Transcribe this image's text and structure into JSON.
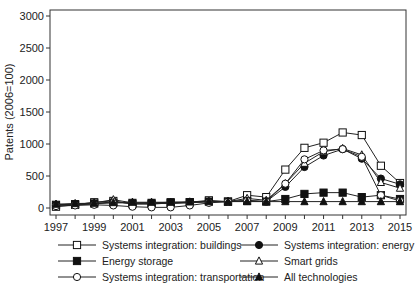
{
  "chart_data": {
    "type": "line",
    "title": "",
    "xlabel": "",
    "ylabel": "Patents (2006=100)",
    "ylim": [
      0,
      3000
    ],
    "yticks": [
      0,
      500,
      1000,
      1500,
      2000,
      2500,
      3000
    ],
    "xticks": [
      1997,
      1999,
      2001,
      2003,
      2005,
      2007,
      2009,
      2011,
      2013,
      2015
    ],
    "x": [
      1997,
      1998,
      1999,
      2000,
      2001,
      2002,
      2003,
      2004,
      2005,
      2006,
      2007,
      2008,
      2009,
      2010,
      2011,
      2012,
      2013,
      2014,
      2015
    ],
    "grid": false,
    "legend_position": "bottom",
    "series": [
      {
        "name": "Systems integration: buildings",
        "marker": "square-open",
        "values": [
          20,
          50,
          90,
          110,
          60,
          60,
          80,
          90,
          120,
          100,
          200,
          170,
          600,
          940,
          1020,
          1180,
          1140,
          660,
          390
        ]
      },
      {
        "name": "Systems integration: energy",
        "marker": "circle-filled",
        "values": [
          40,
          50,
          60,
          100,
          70,
          80,
          80,
          90,
          100,
          100,
          120,
          100,
          330,
          640,
          820,
          920,
          770,
          460,
          370
        ]
      },
      {
        "name": "Energy storage",
        "marker": "square-filled",
        "values": [
          50,
          60,
          70,
          80,
          80,
          80,
          90,
          90,
          100,
          100,
          110,
          100,
          140,
          220,
          240,
          240,
          170,
          200,
          140
        ]
      },
      {
        "name": "Smart grids",
        "marker": "triangle-open",
        "values": [
          50,
          60,
          80,
          130,
          80,
          70,
          70,
          80,
          100,
          100,
          150,
          120,
          380,
          700,
          880,
          930,
          830,
          400,
          310
        ]
      },
      {
        "name": "Systems integration: transportation",
        "marker": "circle-open",
        "values": [
          30,
          40,
          50,
          40,
          20,
          10,
          10,
          40,
          80,
          100,
          110,
          100,
          380,
          760,
          900,
          920,
          800,
          200,
          110
        ]
      },
      {
        "name": "All technologies",
        "marker": "triangle-filled",
        "values": [
          60,
          70,
          75,
          85,
          90,
          90,
          90,
          95,
          100,
          100,
          100,
          100,
          100,
          100,
          100,
          100,
          100,
          100,
          100
        ]
      }
    ]
  }
}
